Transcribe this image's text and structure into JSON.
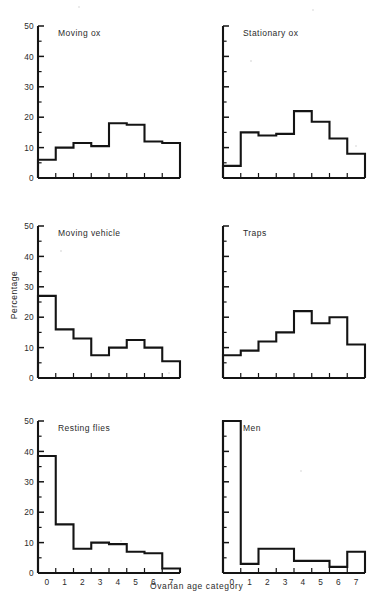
{
  "figure": {
    "xlabel": "Ovarian age category",
    "ylabel": "Percentage",
    "y_ticks": [
      "0",
      "10",
      "20",
      "30",
      "40",
      "50"
    ],
    "x_ticks": [
      "0",
      "1",
      "2",
      "3",
      "4",
      "5",
      "6",
      "7"
    ],
    "ink_color": "#141414",
    "background_color": "#ffffff"
  },
  "chart_data": [
    {
      "type": "bar",
      "title": "Moving ox",
      "xlabel": "Ovarian age category",
      "ylabel": "Percentage",
      "categories": [
        "0",
        "1",
        "2",
        "3",
        "4",
        "5",
        "6",
        "7"
      ],
      "values": [
        6,
        10,
        11.5,
        10.5,
        18,
        17.5,
        12,
        11.5
      ],
      "ylim": [
        0,
        50
      ],
      "xlim": [
        0,
        8
      ],
      "grid": false,
      "legend": "none",
      "y_tick_labels_visible": true
    },
    {
      "type": "bar",
      "title": "Stationary ox",
      "xlabel": "Ovarian age category",
      "ylabel": "Percentage",
      "categories": [
        "0",
        "1",
        "2",
        "3",
        "4",
        "5",
        "6",
        "7"
      ],
      "values": [
        4,
        15,
        14,
        14.5,
        22,
        18.5,
        13,
        8
      ],
      "ylim": [
        0,
        50
      ],
      "xlim": [
        0,
        8
      ],
      "grid": false,
      "legend": "none",
      "y_tick_labels_visible": false
    },
    {
      "type": "bar",
      "title": "Moving vehicle",
      "xlabel": "Ovarian age category",
      "ylabel": "Percentage",
      "categories": [
        "0",
        "1",
        "2",
        "3",
        "4",
        "5",
        "6",
        "7"
      ],
      "values": [
        27,
        16,
        13,
        7.5,
        10,
        12.5,
        10,
        5.5
      ],
      "ylim": [
        0,
        50
      ],
      "xlim": [
        0,
        8
      ],
      "grid": false,
      "legend": "none",
      "y_tick_labels_visible": true
    },
    {
      "type": "bar",
      "title": "Traps",
      "xlabel": "Ovarian age category",
      "ylabel": "Percentage",
      "categories": [
        "0",
        "1",
        "2",
        "3",
        "4",
        "5",
        "6",
        "7"
      ],
      "values": [
        7.5,
        9,
        12,
        15,
        22,
        18,
        20,
        11
      ],
      "ylim": [
        0,
        50
      ],
      "xlim": [
        0,
        8
      ],
      "grid": false,
      "legend": "none",
      "y_tick_labels_visible": false
    },
    {
      "type": "bar",
      "title": "Resting flies",
      "xlabel": "Ovarian age category",
      "ylabel": "Percentage",
      "categories": [
        "0",
        "1",
        "2",
        "3",
        "4",
        "5",
        "6",
        "7"
      ],
      "values": [
        38.5,
        16,
        8,
        10,
        9.5,
        7,
        6.5,
        1.5
      ],
      "ylim": [
        0,
        50
      ],
      "xlim": [
        0,
        8
      ],
      "grid": false,
      "legend": "none",
      "y_tick_labels_visible": true
    },
    {
      "type": "bar",
      "title": "Men",
      "xlabel": "Ovarian age category",
      "ylabel": "Percentage",
      "categories": [
        "0",
        "1",
        "2",
        "3",
        "4",
        "5",
        "6",
        "7"
      ],
      "values": [
        50,
        3,
        8,
        8,
        4,
        4,
        2,
        7
      ],
      "ylim": [
        0,
        50
      ],
      "xlim": [
        0,
        8
      ],
      "grid": false,
      "legend": "none",
      "y_tick_labels_visible": false
    }
  ]
}
